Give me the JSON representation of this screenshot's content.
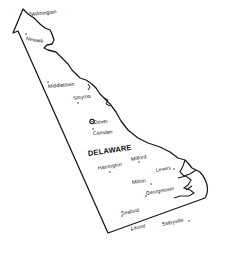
{
  "map": {
    "title": "DELAWARE",
    "outline_color": "#1a1a1a",
    "background": "#ffffff",
    "capital": {
      "name": "Dover",
      "symbol": "star-in-circle"
    },
    "cities": [
      {
        "name": "Wilmington",
        "x": 31,
        "y": 12,
        "rot": -6
      },
      {
        "name": "Newark",
        "x": 26,
        "y": 36,
        "rot": 10
      },
      {
        "name": "Middletown",
        "x": 48,
        "y": 84,
        "rot": -5
      },
      {
        "name": "Smyrna",
        "x": 73,
        "y": 96,
        "rot": -8
      },
      {
        "name": "Dover",
        "x": 94,
        "y": 120,
        "rot": -4
      },
      {
        "name": "Camden",
        "x": 93,
        "y": 131,
        "rot": -4
      },
      {
        "name": "Harrington",
        "x": 98,
        "y": 166,
        "rot": -10
      },
      {
        "name": "Milford",
        "x": 131,
        "y": 157,
        "rot": -10
      },
      {
        "name": "Lewes",
        "x": 156,
        "y": 168,
        "rot": -10
      },
      {
        "name": "Milton",
        "x": 132,
        "y": 180,
        "rot": -8
      },
      {
        "name": "Georgetown",
        "x": 146,
        "y": 191,
        "rot": -10
      },
      {
        "name": "Seaford",
        "x": 121,
        "y": 211,
        "rot": -10
      },
      {
        "name": "Laurel",
        "x": 131,
        "y": 226,
        "rot": -10
      },
      {
        "name": "Selbyville",
        "x": 162,
        "y": 222,
        "rot": -12
      }
    ],
    "state_label": {
      "text": "DELAWARE",
      "x": 88,
      "y": 150,
      "rot": -8
    }
  }
}
